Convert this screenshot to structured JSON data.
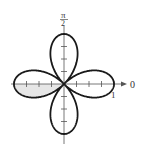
{
  "chart_data": {
    "type": "polar",
    "title": "",
    "equation": "r = cos(2θ)",
    "curve": "four-petaled rose",
    "petals": 4,
    "petal_max_r": 1,
    "petal_directions": [
      "0",
      "π/2",
      "π",
      "3π/2"
    ],
    "shaded_region": "lower half of left petal (θ from π to 5π/4)",
    "axes": {
      "polar_axis_label": "0",
      "vertical_axis_label_num": "π",
      "vertical_axis_label_den": "2",
      "radial_tick_label": "1",
      "radial_ticks": [
        0.25,
        0.5,
        0.75,
        1
      ]
    },
    "colors": {
      "curve": "#1a1a1a",
      "axis": "#555555",
      "shade": "#e6e6e6"
    }
  }
}
